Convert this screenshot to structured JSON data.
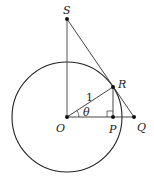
{
  "diagram": {
    "labels": {
      "S": "S",
      "R": "R",
      "O": "O",
      "P": "P",
      "Q": "Q",
      "radius": "1",
      "angle": "θ"
    },
    "points": {
      "S": [
        67,
        19
      ],
      "R": [
        113,
        87
      ],
      "O": [
        67,
        117
      ],
      "P": [
        113,
        117
      ],
      "Q": [
        134,
        117
      ]
    },
    "circle": {
      "cx": 67,
      "cy": 117,
      "r": 55
    },
    "colors": {
      "stroke": "#222222",
      "background": "#ffffff"
    }
  }
}
